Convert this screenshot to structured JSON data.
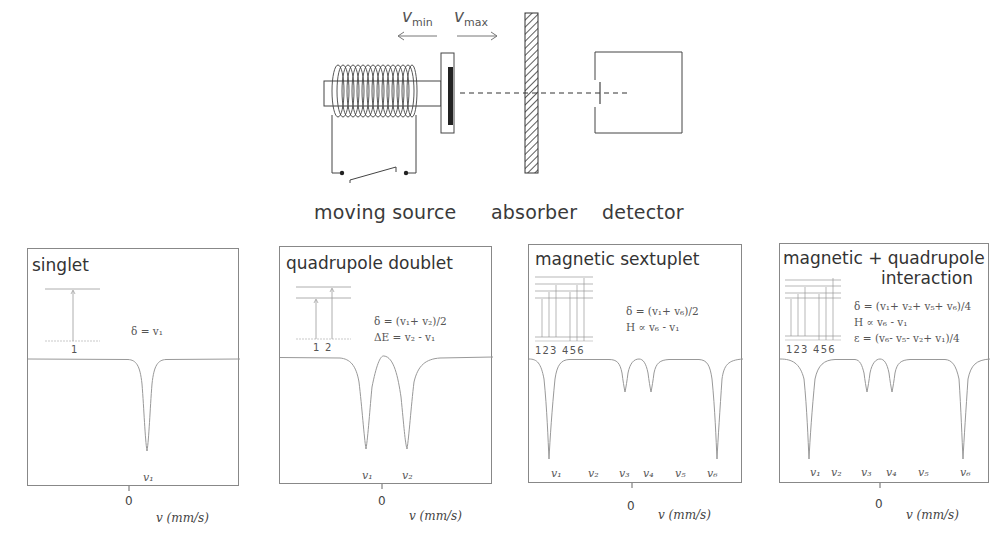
{
  "setup": {
    "labels": {
      "source": "moving source",
      "absorber": "absorber",
      "detector": "detector"
    },
    "velocity": {
      "min_symbol": "v",
      "min_sub": "min",
      "max_symbol": "v",
      "max_sub": "max"
    }
  },
  "panels": [
    {
      "title": "singlet",
      "formulas": [
        "δ = v₁"
      ],
      "level_numbers": "1",
      "peak_labels": [
        "v₁"
      ],
      "zero_label": "0",
      "axis_label": "v (mm/s)"
    },
    {
      "title": "quadrupole doublet",
      "formulas": [
        "δ  = (v₁+ v₂)/2",
        "ΔE =  v₂ - v₁"
      ],
      "level_numbers": "1  2",
      "peak_labels": [
        "v₁",
        "v₂"
      ],
      "zero_label": "0",
      "axis_label": "v (mm/s)"
    },
    {
      "title": "magnetic sextuplet",
      "formulas": [
        "δ  = (v₁+ v₆)/2",
        "H  ∝  v₆ - v₁"
      ],
      "level_numbers": "123 456",
      "peak_labels": [
        "v₁",
        "v₂",
        "v₃",
        "v₄",
        "v₅",
        "v₆"
      ],
      "zero_label": "0",
      "axis_label": "v (mm/s)"
    },
    {
      "title_line1": "magnetic + quadrupole",
      "title_line2": "interaction",
      "formulas": [
        "δ  = (v₁+ v₂+ v₅+ v₆)/4",
        "H  ∝  v₆ - v₁",
        "ε  = (v₆- v₅- v₂+ v₁)/4"
      ],
      "level_numbers": "123 456",
      "peak_labels": [
        "v₁",
        "v₂",
        "v₃",
        "v₄",
        "v₅",
        "v₆"
      ],
      "zero_label": "0",
      "axis_label": "v (mm/s)"
    }
  ],
  "colors": {
    "line": "#555555",
    "frame": "#888888",
    "spectrum": "#999999",
    "absorber_hatch": "#444444"
  }
}
